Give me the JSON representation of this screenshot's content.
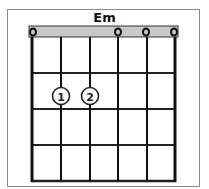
{
  "chord": {
    "name": "Em",
    "strings": 6,
    "frets": 4,
    "open_markers": [
      {
        "string": 1,
        "symbol": "o"
      },
      {
        "string": 4,
        "symbol": "o"
      },
      {
        "string": 5,
        "symbol": "o"
      },
      {
        "string": 6,
        "symbol": "o"
      }
    ],
    "fingers": [
      {
        "string": 2,
        "fret": 2,
        "finger": "1"
      },
      {
        "string": 3,
        "fret": 2,
        "finger": "2"
      }
    ]
  },
  "colors": {
    "nut": "#c8c8c8",
    "lines": "#111111",
    "frame": "#8a8a8a"
  }
}
